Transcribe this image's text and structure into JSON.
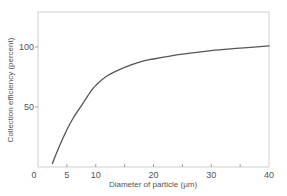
{
  "chart_data": {
    "type": "line",
    "title": "",
    "xlabel": "Diameter of particle (μm)",
    "ylabel": "Collection efficiency (percent)",
    "xlim": [
      0,
      40
    ],
    "ylim": [
      0,
      129
    ],
    "grid": false,
    "legend": null,
    "x_ticks": [
      0,
      5,
      10,
      15,
      20,
      25,
      30,
      35,
      40
    ],
    "x_tick_labels": [
      "0",
      "5",
      "10",
      "",
      "20",
      "",
      "30",
      "",
      "40"
    ],
    "y_ticks": [
      50,
      100
    ],
    "y_tick_labels": [
      "50",
      "100"
    ],
    "series": [
      {
        "name": "Collection efficiency",
        "color": "#555555",
        "x": [
          2.5,
          3.5,
          5,
          6,
          7.5,
          9,
          10,
          12,
          15,
          18,
          20,
          25,
          30,
          35,
          40
        ],
        "y": [
          3,
          15,
          31,
          40,
          51,
          62,
          68,
          76,
          83,
          88,
          90,
          94,
          97,
          99,
          101
        ]
      }
    ]
  },
  "colors": {
    "frame": "#b8b8b8",
    "curve": "#555555",
    "text": "#555555"
  }
}
